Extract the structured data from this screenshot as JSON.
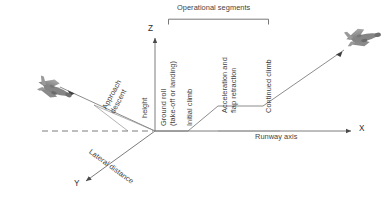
{
  "figure": {
    "title_bracket": "Operational segments",
    "axes": {
      "z": {
        "label": "Z",
        "name": "vertical-axis"
      },
      "x": {
        "label": "X",
        "name": "runway-axis",
        "caption": "Runway axis"
      },
      "y": {
        "label": "Y",
        "name": "lateral-axis",
        "caption": "Lateral distance"
      }
    },
    "labels": {
      "height": "height",
      "approach_descent_line1": "Approach",
      "approach_descent_line2": "descent",
      "ground_roll_line1": "Ground roll",
      "ground_roll_line2": "(take-off or landing)",
      "initial_climb": "Initial climb",
      "acceleration_line1": "Acceleration and",
      "acceleration_line2": "flap retraction",
      "continued_climb": "Continued climb"
    },
    "aircraft": {
      "approaching": "aircraft-approaching",
      "departing": "aircraft-departing"
    },
    "colors": {
      "line": "#5a5a5a",
      "text": "#3f3f3f",
      "aircraft_body": "#8e8e8e",
      "aircraft_dark": "#6d6d6d",
      "background": "#ffffff"
    }
  }
}
